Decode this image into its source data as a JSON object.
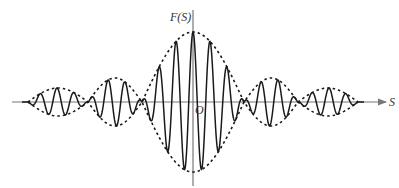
{
  "diagram": {
    "type": "wave-packet / beat envelope",
    "labels": {
      "y_axis": "F(S)",
      "x_axis": "S",
      "origin": "O"
    },
    "colors": {
      "axis": "#777777",
      "wave": "#1a1a1a",
      "envelope": "#1a1a1a",
      "background": "#ffffff"
    },
    "geometry": {
      "axis_y": 102,
      "axis_x": 193,
      "x_axis_start": 12,
      "x_axis_end": 386,
      "y_axis_top": 10,
      "y_axis_bottom": 186,
      "envelope_nodes": [
        28,
        88,
        142,
        244,
        298,
        358
      ],
      "lobe_amplitudes": [
        {
          "from": 28,
          "to": 88,
          "amp": 14
        },
        {
          "from": 88,
          "to": 142,
          "amp": 24
        },
        {
          "from": 142,
          "to": 244,
          "amp": 70
        },
        {
          "from": 244,
          "to": 298,
          "amp": 24
        },
        {
          "from": 298,
          "to": 358,
          "amp": 14
        }
      ],
      "carrier_period": 17
    }
  }
}
